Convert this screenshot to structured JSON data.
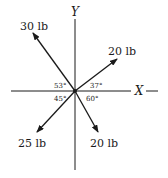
{
  "diagram": {
    "type": "force-vector-diagram",
    "origin": {
      "x": 75,
      "y": 91
    },
    "axes": {
      "x": {
        "label": "X",
        "from": [
          11,
          91
        ],
        "to": [
          131,
          91
        ],
        "label_pos": [
          139,
          95
        ],
        "tail_from": [
          146,
          91
        ],
        "tail_to": [
          158,
          91
        ]
      },
      "y": {
        "label": "Y",
        "from": [
          75,
          19
        ],
        "to": [
          75,
          170
        ],
        "label_pos": [
          75,
          16
        ]
      }
    },
    "forces": [
      {
        "id": "f1",
        "label": "30 lb",
        "magnitude": 30,
        "unit": "lb",
        "angle_label": "53°",
        "angle_ref": "from negative x-axis, upward",
        "tip": [
          33,
          33
        ],
        "label_pos": [
          20,
          30
        ]
      },
      {
        "id": "f2",
        "label": "20 lb",
        "magnitude": 20,
        "unit": "lb",
        "angle_label": "37°",
        "angle_ref": "from positive x-axis, upward",
        "tip": [
          117,
          59
        ],
        "label_pos": [
          108,
          55
        ]
      },
      {
        "id": "f3",
        "label": "25 lb",
        "magnitude": 25,
        "unit": "lb",
        "angle_label": "45°",
        "angle_ref": "from negative x-axis, downward",
        "tip": [
          37,
          132
        ],
        "label_pos": [
          18,
          147
        ]
      },
      {
        "id": "f4",
        "label": "20 lb",
        "magnitude": 20,
        "unit": "lb",
        "angle_label": "60°",
        "angle_ref": "from positive x-axis, downward",
        "tip": [
          98,
          132
        ],
        "label_pos": [
          90,
          147
        ]
      }
    ],
    "angle_labels": [
      {
        "text": "53°",
        "pos": [
          54,
          88
        ]
      },
      {
        "text": "37°",
        "pos": [
          90,
          88
        ]
      },
      {
        "text": "45°",
        "pos": [
          54,
          101
        ]
      },
      {
        "text": "60°",
        "pos": [
          86,
          101
        ]
      }
    ],
    "colors": {
      "line": "#1a1a1a",
      "background": "#ffffff"
    }
  }
}
